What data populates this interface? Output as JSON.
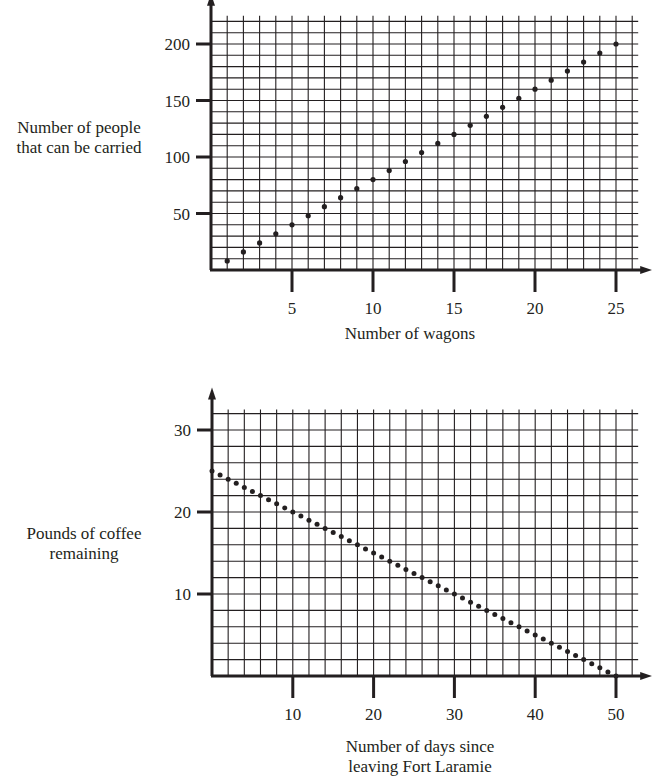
{
  "chart_data": [
    {
      "type": "scatter",
      "title": "",
      "xlabel": "Number of wagons",
      "ylabel": "Number of people that can be carried",
      "ylabel_lines": [
        "Number of people",
        "that can be carried"
      ],
      "xlim": [
        0,
        26
      ],
      "ylim": [
        0,
        225
      ],
      "x_ticks": [
        5,
        10,
        15,
        20,
        25
      ],
      "y_ticks": [
        50,
        100,
        150,
        200
      ],
      "grid": true,
      "grid_step_x": 1,
      "grid_step_y": 10,
      "legend": null,
      "series": [
        {
          "name": "people",
          "x": [
            1,
            2,
            3,
            4,
            5,
            6,
            7,
            8,
            9,
            10,
            11,
            12,
            13,
            14,
            15,
            16,
            17,
            18,
            19,
            20,
            21,
            22,
            23,
            24,
            25
          ],
          "y": [
            8,
            16,
            24,
            32,
            40,
            48,
            56,
            64,
            72,
            80,
            88,
            96,
            104,
            112,
            120,
            128,
            136,
            144,
            152,
            160,
            168,
            176,
            184,
            192,
            200
          ]
        }
      ]
    },
    {
      "type": "scatter",
      "title": "",
      "xlabel": "Number of days since leaving Fort Laramie",
      "xlabel_lines": [
        "Number of days since",
        "leaving Fort Laramie"
      ],
      "ylabel": "Pounds of coffee remaining",
      "ylabel_lines": [
        "Pounds of coffee",
        "remaining"
      ],
      "xlim": [
        0,
        52
      ],
      "ylim": [
        0,
        32.5
      ],
      "x_ticks": [
        10,
        20,
        30,
        40,
        50
      ],
      "y_ticks": [
        10,
        20,
        30
      ],
      "grid": true,
      "grid_step_x": 2,
      "grid_step_y": 2,
      "legend": null,
      "series": [
        {
          "name": "coffee",
          "x": [
            0,
            1,
            2,
            3,
            4,
            5,
            6,
            7,
            8,
            9,
            10,
            11,
            12,
            13,
            14,
            15,
            16,
            17,
            18,
            19,
            20,
            21,
            22,
            23,
            24,
            25,
            26,
            27,
            28,
            29,
            30,
            31,
            32,
            33,
            34,
            35,
            36,
            37,
            38,
            39,
            40,
            41,
            42,
            43,
            44,
            45,
            46,
            47,
            48,
            49,
            50
          ],
          "y": [
            25,
            24.5,
            24,
            23.5,
            23,
            22.5,
            22,
            21.5,
            21,
            20.5,
            20,
            19.5,
            19,
            18.5,
            18,
            17.5,
            17,
            16.5,
            16,
            15.5,
            15,
            14.5,
            14,
            13.5,
            13,
            12.5,
            12,
            11.5,
            11,
            10.5,
            10,
            9.5,
            9,
            8.5,
            8,
            7.5,
            7,
            6.5,
            6,
            5.5,
            5,
            4.5,
            4,
            3.5,
            3,
            2.5,
            2,
            1.5,
            1,
            0.5,
            0
          ]
        }
      ]
    }
  ]
}
